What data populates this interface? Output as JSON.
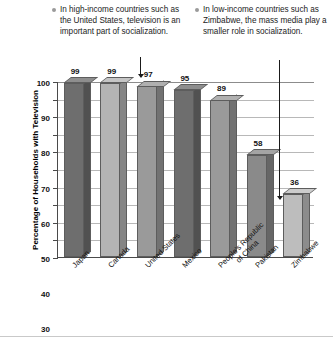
{
  "figure": {
    "callouts": [
      {
        "id": "high-income",
        "text": "In high-income countries such as the United States, television is an important part of socialization."
      },
      {
        "id": "low-income",
        "text": "In low-income countries such as Zimbabwe, the mass media play a smaller role in socialization."
      }
    ],
    "annotations": [
      {
        "id": "arrow-to-united-states",
        "target": "United States"
      },
      {
        "id": "arrow-to-zimbabwe",
        "target": "Zimbabwe"
      }
    ]
  },
  "chart_data": {
    "type": "bar",
    "title": "",
    "xlabel": "",
    "ylabel": "Percentage of Households with Television",
    "ylim": [
      0,
      100
    ],
    "yticks": [
      0,
      10,
      20,
      30,
      40,
      50,
      60,
      70,
      80,
      90,
      100
    ],
    "grid": true,
    "legend": "none",
    "categories": [
      "Japan",
      "Canada",
      "United States",
      "Mexico",
      "People's Republic of China",
      "Pakistan",
      "Zimbabwe"
    ],
    "category_lines": [
      [
        "Japan"
      ],
      [
        "Canada"
      ],
      [
        "United States"
      ],
      [
        "Mexico"
      ],
      [
        "People's Republic",
        "of China"
      ],
      [
        "Pakistan"
      ],
      [
        "Zimbabwe"
      ]
    ],
    "values": [
      99,
      99,
      97,
      95,
      89,
      58,
      36
    ],
    "bar_colors": [
      "#6e6e6e",
      "#b4b4b4",
      "#9a9a9a",
      "#6e6e6e",
      "#9a9a9a",
      "#8a8a8a",
      "#bdbdbd"
    ]
  }
}
